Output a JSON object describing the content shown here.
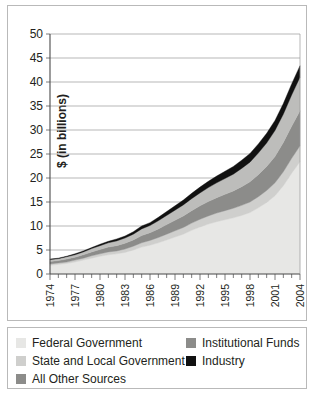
{
  "chart_data": {
    "type": "area",
    "stacked": true,
    "title": "",
    "xlabel": "",
    "ylabel": "$ (in billions)",
    "ylim": [
      0,
      50
    ],
    "ytick_labels": [
      "0",
      "5",
      "10",
      "15",
      "20",
      "25",
      "30",
      "35",
      "40",
      "45",
      "50"
    ],
    "ytick_values": [
      0,
      5,
      10,
      15,
      20,
      25,
      30,
      35,
      40,
      45,
      50
    ],
    "grid": true,
    "grid_axis": "y",
    "legend_position": "below-plot",
    "xlim": [
      1974,
      2004
    ],
    "x": [
      1974,
      1975,
      1976,
      1977,
      1978,
      1979,
      1980,
      1981,
      1982,
      1983,
      1984,
      1985,
      1986,
      1987,
      1988,
      1989,
      1990,
      1991,
      1992,
      1993,
      1994,
      1995,
      1996,
      1997,
      1998,
      1999,
      2000,
      2001,
      2002,
      2003,
      2004
    ],
    "xtick_labels": [
      "1974",
      "1977",
      "1980",
      "1983",
      "1986",
      "1989",
      "1992",
      "1995",
      "1998",
      "2001",
      "2004"
    ],
    "xtick_values": [
      1974,
      1977,
      1980,
      1983,
      1986,
      1989,
      1992,
      1995,
      1998,
      2001,
      2004
    ],
    "series": [
      {
        "name": "Federal Government",
        "color": "#e7e7e5",
        "values": [
          1.8,
          2.0,
          2.2,
          2.5,
          2.9,
          3.3,
          3.7,
          4.0,
          4.2,
          4.5,
          5.0,
          5.6,
          6.0,
          6.5,
          7.1,
          7.7,
          8.3,
          9.1,
          9.8,
          10.4,
          10.9,
          11.3,
          11.7,
          12.2,
          12.8,
          13.8,
          14.9,
          16.3,
          18.4,
          21.0,
          23.4
        ]
      },
      {
        "name": "State and Local Government",
        "color": "#cfcfcd",
        "values": [
          0.3,
          0.3,
          0.3,
          0.4,
          0.4,
          0.5,
          0.5,
          0.6,
          0.6,
          0.7,
          0.8,
          0.9,
          1.0,
          1.1,
          1.2,
          1.3,
          1.4,
          1.5,
          1.6,
          1.7,
          1.8,
          1.9,
          2.0,
          2.1,
          2.2,
          2.3,
          2.5,
          2.7,
          2.9,
          3.1,
          3.3
        ]
      },
      {
        "name": "All Other Sources",
        "color": "#8c8c8a",
        "values": [
          0.5,
          0.5,
          0.6,
          0.6,
          0.7,
          0.8,
          0.9,
          1.0,
          1.1,
          1.2,
          1.3,
          1.5,
          1.6,
          1.8,
          2.0,
          2.2,
          2.4,
          2.6,
          2.8,
          3.0,
          3.2,
          3.4,
          3.6,
          3.9,
          4.2,
          4.6,
          5.0,
          5.5,
          6.1,
          6.7,
          7.3
        ]
      },
      {
        "name": "Institutional Funds",
        "color": "#bdbdbb",
        "values": [
          0.4,
          0.4,
          0.5,
          0.5,
          0.6,
          0.7,
          0.8,
          0.9,
          1.0,
          1.1,
          1.2,
          1.4,
          1.5,
          1.7,
          1.9,
          2.1,
          2.3,
          2.5,
          2.7,
          2.9,
          3.1,
          3.3,
          3.5,
          3.8,
          4.1,
          4.5,
          4.9,
          5.4,
          5.9,
          6.5,
          7.0
        ]
      },
      {
        "name": "Industry",
        "color": "#111111",
        "values": [
          0.1,
          0.1,
          0.1,
          0.2,
          0.2,
          0.2,
          0.3,
          0.3,
          0.4,
          0.4,
          0.5,
          0.6,
          0.6,
          0.7,
          0.8,
          0.9,
          1.0,
          1.1,
          1.2,
          1.3,
          1.4,
          1.5,
          1.6,
          1.7,
          1.8,
          1.9,
          2.0,
          2.1,
          2.2,
          2.3,
          2.4
        ]
      }
    ]
  },
  "legend": {
    "left_items": [
      {
        "label": "Federal Government",
        "color": "#e7e7e5"
      },
      {
        "label": "State and Local Government",
        "color": "#cfcfcd"
      },
      {
        "label": "All Other Sources",
        "color": "#8c8c8a"
      }
    ],
    "right_items": [
      {
        "label": "Institutional Funds",
        "color": "#8c8c8a"
      },
      {
        "label": "Industry",
        "color": "#111111"
      }
    ]
  }
}
